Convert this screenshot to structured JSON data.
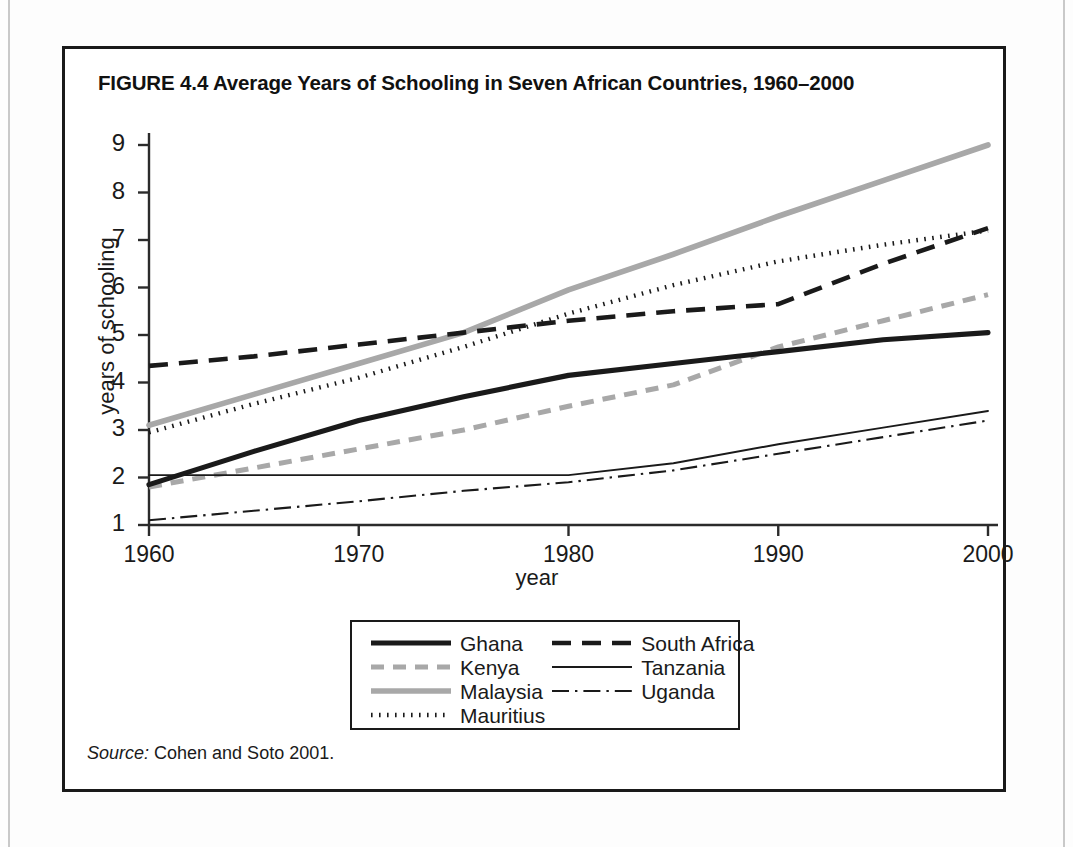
{
  "figure": {
    "title": "FIGURE 4.4  Average Years of Schooling in Seven African Countries, 1960–2000",
    "source_word": "Source:",
    "source_text": " Cohen and Soto 2001."
  },
  "legend": {
    "column_1": [
      {
        "label": "Ghana",
        "style": "thick-solid-black"
      },
      {
        "label": "Kenya",
        "style": "gray-dashed"
      },
      {
        "label": "Malaysia",
        "style": "thick-solid-gray"
      },
      {
        "label": "Mauritius",
        "style": "black-dotted"
      }
    ],
    "column_2": [
      {
        "label": "South Africa",
        "style": "black-dashed"
      },
      {
        "label": "Tanzania",
        "style": "thin-solid-black"
      },
      {
        "label": "Uganda",
        "style": "black-dash-dot"
      }
    ]
  },
  "colors": {
    "ink": "#1a1a1a",
    "gray_series": "#a8a8a8",
    "axis": "#2b2b2b",
    "page_background": "#ffffff"
  },
  "chart_data": {
    "type": "line",
    "title": "Average Years of Schooling in Seven African Countries, 1960–2000",
    "xlabel": "year",
    "ylabel": "years of schooling",
    "x": [
      1960,
      1965,
      1970,
      1975,
      1980,
      1985,
      1990,
      1995,
      2000
    ],
    "xlim": [
      1960,
      2000
    ],
    "ylim": [
      1,
      9
    ],
    "xticks": [
      1960,
      1970,
      1980,
      1990,
      2000
    ],
    "yticks": [
      1,
      2,
      3,
      4,
      5,
      6,
      7,
      8,
      9
    ],
    "xtick_labels": [
      "1960",
      "1970",
      "1980",
      "1990",
      "2000"
    ],
    "ytick_labels": [
      "1",
      "2",
      "3",
      "4",
      "5",
      "6",
      "7",
      "8",
      "9"
    ],
    "grid": false,
    "legend_position": "below-center",
    "series": [
      {
        "name": "Ghana",
        "style": "thick-solid-black",
        "color": "#1a1a1a",
        "values": [
          1.85,
          2.55,
          3.2,
          3.7,
          4.15,
          4.4,
          4.65,
          4.9,
          5.05
        ]
      },
      {
        "name": "Kenya",
        "style": "gray-dashed",
        "color": "#a8a8a8",
        "values": [
          1.8,
          2.2,
          2.6,
          3.0,
          3.5,
          3.95,
          4.75,
          5.3,
          5.85
        ]
      },
      {
        "name": "Malaysia",
        "style": "thick-solid-gray",
        "color": "#a8a8a8",
        "values": [
          3.1,
          3.75,
          4.4,
          5.05,
          5.95,
          6.7,
          7.5,
          8.25,
          9.0
        ]
      },
      {
        "name": "Mauritius",
        "style": "black-dotted",
        "color": "#1a1a1a",
        "values": [
          2.95,
          3.55,
          4.1,
          4.75,
          5.45,
          6.05,
          6.55,
          6.9,
          7.2
        ]
      },
      {
        "name": "South Africa",
        "style": "black-dashed",
        "color": "#1a1a1a",
        "values": [
          4.35,
          4.55,
          4.8,
          5.05,
          5.3,
          5.5,
          5.65,
          6.5,
          7.25
        ]
      },
      {
        "name": "Tanzania",
        "style": "thin-solid-black",
        "color": "#1a1a1a",
        "values": [
          2.05,
          2.05,
          2.05,
          2.05,
          2.05,
          2.3,
          2.7,
          3.05,
          3.4
        ]
      },
      {
        "name": "Uganda",
        "style": "black-dash-dot",
        "color": "#1a1a1a",
        "values": [
          1.1,
          1.3,
          1.5,
          1.72,
          1.9,
          2.15,
          2.5,
          2.85,
          3.2
        ]
      }
    ]
  }
}
